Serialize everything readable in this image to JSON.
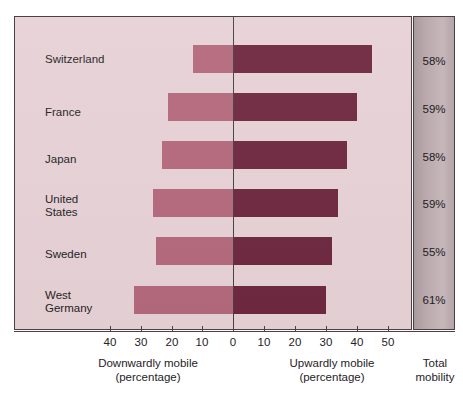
{
  "chart_data": {
    "type": "bar",
    "title": "",
    "subtitle": "",
    "orientation": "horizontal-diverging",
    "categories": [
      "Switzerland",
      "France",
      "Japan",
      "United\nStates",
      "Sweden",
      "West\nGermany"
    ],
    "series": [
      {
        "name": "Downwardly mobile (percentage)",
        "values": [
          13,
          21,
          23,
          26,
          25,
          32
        ],
        "color": "#b4697c"
      },
      {
        "name": "Upwardly mobile (percentage)",
        "values": [
          45,
          40,
          37,
          34,
          32,
          30
        ],
        "color": "#6e2840"
      }
    ],
    "annotations": {
      "total_mobility_label": "Total mobility",
      "total_mobility_values": [
        "58%",
        "59%",
        "58%",
        "59%",
        "55%",
        "61%"
      ]
    },
    "xlabel": "",
    "ylabel": "",
    "xlim": [
      -45,
      57
    ],
    "tick_values": [
      -40,
      -30,
      -20,
      -10,
      0,
      10,
      20,
      30,
      40,
      50
    ],
    "tick_labels": [
      "40",
      "30",
      "20",
      "10",
      "0",
      "10",
      "20",
      "30",
      "40",
      "50"
    ],
    "grid": false,
    "legend": "none"
  },
  "axis": {
    "ticks": [
      {
        "label": "40",
        "x": 110
      },
      {
        "label": "30",
        "x": 141
      },
      {
        "label": "20",
        "x": 172
      },
      {
        "label": "10",
        "x": 202
      },
      {
        "label": "0",
        "x": 233
      },
      {
        "label": "10",
        "x": 264
      },
      {
        "label": "20",
        "x": 295
      },
      {
        "label": "30",
        "x": 326
      },
      {
        "label": "40",
        "x": 357
      },
      {
        "label": "50",
        "x": 388
      }
    ]
  },
  "rows": [
    {
      "label": "Switzerland",
      "label_y": 52,
      "bar_y": 44,
      "down": 13,
      "up": 45,
      "total": "58%",
      "total_y": 54
    },
    {
      "label": "France",
      "label_y": 105,
      "bar_y": 92,
      "down": 21,
      "up": 40,
      "total": "59%",
      "total_y": 102
    },
    {
      "label": "Japan",
      "label_y": 152,
      "bar_y": 140,
      "down": 23,
      "up": 37,
      "total": "58%",
      "total_y": 150
    },
    {
      "label": "United\nStates",
      "label_y": 192,
      "bar_y": 188,
      "down": 26,
      "up": 34,
      "total": "59%",
      "total_y": 197
    },
    {
      "label": "Sweden",
      "label_y": 247,
      "bar_y": 236,
      "down": 25,
      "up": 32,
      "total": "55%",
      "total_y": 245
    },
    {
      "label": "West\nGermany",
      "label_y": 288,
      "bar_y": 285,
      "down": 32,
      "up": 30,
      "total": "61%",
      "total_y": 293
    }
  ],
  "captions": {
    "downward": "Downwardly mobile\n(percentage)",
    "upward": "Upwardly mobile\n(percentage)",
    "total": "Total\nmobility"
  }
}
